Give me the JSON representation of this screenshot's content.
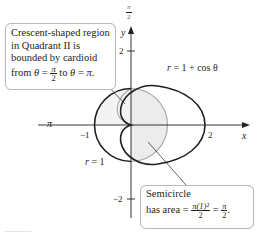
{
  "figure": {
    "axes": {
      "x_label": "x",
      "y_label": "y",
      "polar_axis_label_top": "π/2",
      "polar_axis_label_left": "π",
      "x_ticks": [
        {
          "value": -1,
          "label": "−1"
        },
        {
          "value": 2,
          "label": "2"
        }
      ],
      "y_ticks": [
        {
          "value": 2,
          "label": "2"
        },
        {
          "value": -2,
          "label": "−2"
        }
      ]
    },
    "curves": [
      {
        "name": "cardioid",
        "equation": "r = 1 + cos θ",
        "label_lhs": "r",
        "label_rhs": "= 1 + cos θ",
        "color": "#231f20"
      },
      {
        "name": "circle",
        "equation": "r = 1",
        "label_lhs": "r",
        "label_rhs": "= 1",
        "color": "#231f20"
      }
    ],
    "shading": {
      "color": "#ececec",
      "edge_color": "#a8a8a8"
    },
    "callouts": {
      "top": {
        "lines": [
          "Crescent-shaped region",
          "in Quadrant II is",
          "bounded by cardioid"
        ],
        "last_line_prefix": "from ",
        "theta": "θ",
        "eq": " = ",
        "frac_num": "π",
        "frac_den": "2",
        "to": " to ",
        "theta2": "θ",
        "eq2": " = ",
        "end": "π",
        "period": "."
      },
      "bottom": {
        "line1": "Semicircle",
        "line2_prefix": "has area = ",
        "frac1_num": "π(1)²",
        "frac1_den": "2",
        "eq": " = ",
        "frac2_num": "π",
        "frac2_den": "2",
        "period": "."
      }
    }
  }
}
